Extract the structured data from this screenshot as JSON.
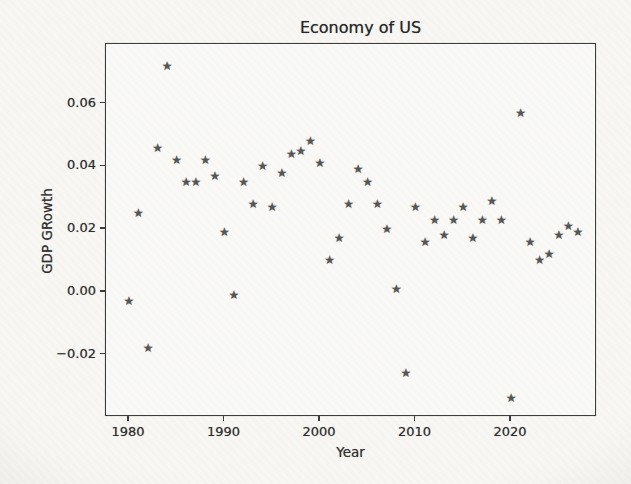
{
  "figure_kind": "photographed matplotlib scatter figure",
  "chart_data": {
    "type": "scatter",
    "title": "Economy of US",
    "xlabel": "Year",
    "ylabel": "GDP GRowth",
    "legend": "none",
    "grid": false,
    "marker": "star",
    "marker_color": "#565656",
    "x": [
      1980,
      1981,
      1982,
      1983,
      1984,
      1985,
      1986,
      1987,
      1988,
      1989,
      1990,
      1991,
      1992,
      1993,
      1994,
      1995,
      1996,
      1997,
      1998,
      1999,
      2000,
      2001,
      2002,
      2003,
      2004,
      2005,
      2006,
      2007,
      2008,
      2009,
      2010,
      2011,
      2012,
      2013,
      2014,
      2015,
      2016,
      2017,
      2018,
      2019,
      2020,
      2021,
      2022,
      2023,
      2024,
      2025,
      2026,
      2027
    ],
    "y": [
      -0.003,
      0.025,
      -0.018,
      0.046,
      0.072,
      0.042,
      0.035,
      0.035,
      0.042,
      0.037,
      0.019,
      -0.001,
      0.035,
      0.028,
      0.04,
      0.027,
      0.038,
      0.044,
      0.045,
      0.048,
      0.041,
      0.01,
      0.017,
      0.028,
      0.039,
      0.035,
      0.028,
      0.02,
      0.001,
      -0.026,
      0.027,
      0.016,
      0.023,
      0.018,
      0.023,
      0.027,
      0.017,
      0.023,
      0.029,
      0.023,
      -0.034,
      0.057,
      0.016,
      0.01,
      0.012,
      0.018,
      0.021,
      0.019
    ],
    "xlim": [
      1977.6,
      2029.0
    ],
    "ylim": [
      -0.0399,
      0.079
    ],
    "xticks": [
      {
        "label": "1980",
        "value": 1980
      },
      {
        "label": "1990",
        "value": 1990
      },
      {
        "label": "2000",
        "value": 2000
      },
      {
        "label": "2010",
        "value": 2010
      },
      {
        "label": "2020",
        "value": 2020
      }
    ],
    "yticks": [
      {
        "label": "0.06",
        "value": 0.06
      },
      {
        "label": "0.04",
        "value": 0.04
      },
      {
        "label": "0.02",
        "value": 0.02
      },
      {
        "label": "0.00",
        "value": 0.0
      },
      {
        "label": "−0.02",
        "value": -0.02
      }
    ],
    "star_glyph": "★"
  }
}
